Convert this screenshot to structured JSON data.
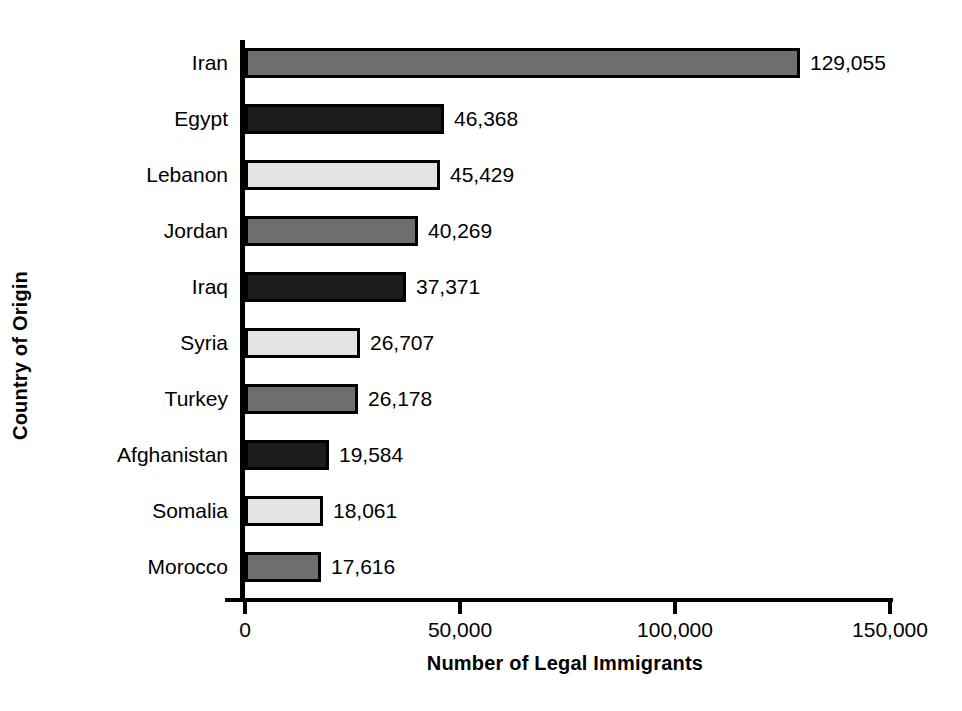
{
  "chart_data": {
    "type": "bar",
    "orientation": "horizontal",
    "title": "",
    "xlabel": "Number of Legal Immigrants",
    "ylabel": "Country of Origin",
    "categories": [
      "Iran",
      "Egypt",
      "Lebanon",
      "Jordan",
      "Iraq",
      "Syria",
      "Turkey",
      "Afghanistan",
      "Somalia",
      "Morocco"
    ],
    "values": [
      129055,
      46368,
      45429,
      40269,
      37371,
      26707,
      26178,
      19584,
      18061,
      17616
    ],
    "value_labels": [
      "129,055",
      "46,368",
      "45,429",
      "40,269",
      "37,371",
      "26,707",
      "26,178",
      "19,584",
      "18,061",
      "17,616"
    ],
    "bar_tones": [
      "mid",
      "dark",
      "light",
      "mid",
      "dark",
      "light",
      "mid",
      "dark",
      "light",
      "mid"
    ],
    "tone_colors": {
      "mid": "#6e6e6e",
      "dark": "#1c1c1c",
      "light": "#e3e3e3",
      "outline": "#000000"
    },
    "xlim": [
      0,
      150000
    ],
    "xticks": [
      0,
      50000,
      100000,
      150000
    ],
    "xtick_labels": [
      "0",
      "50,000",
      "100,000",
      "150,000"
    ],
    "grid": false,
    "legend": null,
    "background": "#ffffff"
  }
}
